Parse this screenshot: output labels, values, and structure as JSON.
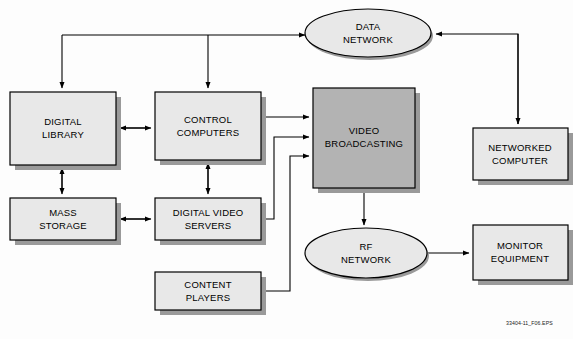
{
  "diagram": {
    "caption": "33404-11_F06.EPS",
    "colors": {
      "background": "#fdfdfd",
      "node_fill": "#e8e8e8",
      "highlight_fill": "#b3b3b3",
      "stroke": "#000000",
      "shadow": "#9a9a9a",
      "text": "#000000"
    },
    "nodes": [
      {
        "id": "data-network",
        "label_line1": "DATA",
        "label_line2": "NETWORK",
        "shape": "ellipse",
        "cx": 368,
        "cy": 33,
        "rx": 63,
        "ry": 24,
        "fill": "#e8e8e8"
      },
      {
        "id": "digital-library",
        "label_line1": "DIGITAL",
        "label_line2": "LIBRARY",
        "shape": "rect",
        "x": 10,
        "y": 92,
        "w": 106,
        "h": 73,
        "fill": "#e8e8e8"
      },
      {
        "id": "control-computers",
        "label_line1": "CONTROL",
        "label_line2": "COMPUTERS",
        "shape": "rect",
        "x": 155,
        "y": 92,
        "w": 106,
        "h": 68,
        "fill": "#e8e8e8"
      },
      {
        "id": "video-broadcasting",
        "label_line1": "VIDEO",
        "label_line2": "BROADCASTING",
        "shape": "rect",
        "x": 313,
        "y": 88,
        "w": 102,
        "h": 100,
        "fill": "#b3b3b3"
      },
      {
        "id": "networked-computer",
        "label_line1": "NETWORKED",
        "label_line2": "COMPUTER",
        "shape": "rect",
        "x": 473,
        "y": 128,
        "w": 95,
        "h": 52,
        "fill": "#e8e8e8"
      },
      {
        "id": "mass-storage",
        "label_line1": "MASS",
        "label_line2": "STORAGE",
        "shape": "rect",
        "x": 10,
        "y": 198,
        "w": 106,
        "h": 42,
        "fill": "#e8e8e8"
      },
      {
        "id": "digital-video-servers",
        "label_line1": "DIGITAL VIDEO",
        "label_line2": "SERVERS",
        "shape": "rect",
        "x": 155,
        "y": 198,
        "w": 106,
        "h": 42,
        "fill": "#e8e8e8"
      },
      {
        "id": "content-players",
        "label_line1": "CONTENT",
        "label_line2": "PLAYERS",
        "shape": "rect",
        "x": 155,
        "y": 272,
        "w": 106,
        "h": 38,
        "fill": "#e8e8e8"
      },
      {
        "id": "rf-network",
        "label_line1": "RF",
        "label_line2": "NETWORK",
        "shape": "ellipse",
        "cx": 366,
        "cy": 253,
        "rx": 61,
        "ry": 25,
        "fill": "#e8e8e8"
      },
      {
        "id": "monitor-equipment",
        "label_line1": "MONITOR",
        "label_line2": "EQUIPMENT",
        "shape": "rect",
        "x": 473,
        "y": 225,
        "w": 95,
        "h": 55,
        "fill": "#e8e8e8"
      }
    ],
    "connections": [
      {
        "id": "bus-to-digital-library",
        "from": "data-bus",
        "to": "digital-library"
      },
      {
        "id": "bus-to-control-computers",
        "from": "data-bus",
        "to": "control-computers"
      },
      {
        "id": "bus-to-data-network",
        "from": "data-bus",
        "to": "data-network"
      },
      {
        "id": "networked-computer-to-data-network",
        "from": "networked-computer",
        "to": "data-network"
      },
      {
        "id": "digital-library-to-control-computers",
        "from": "digital-library",
        "to": "control-computers"
      },
      {
        "id": "digital-library-to-mass-storage",
        "from": "digital-library",
        "to": "mass-storage"
      },
      {
        "id": "mass-storage-to-digital-video-servers",
        "from": "mass-storage",
        "to": "digital-video-servers"
      },
      {
        "id": "control-computers-to-digital-video-servers",
        "from": "control-computers",
        "to": "digital-video-servers"
      },
      {
        "id": "control-computers-to-video-broadcasting",
        "from": "control-computers",
        "to": "video-broadcasting"
      },
      {
        "id": "digital-video-servers-to-video-broadcasting",
        "from": "digital-video-servers",
        "to": "video-broadcasting"
      },
      {
        "id": "content-players-to-video-broadcasting",
        "from": "content-players",
        "to": "video-broadcasting"
      },
      {
        "id": "video-broadcasting-to-rf-network",
        "from": "video-broadcasting",
        "to": "rf-network"
      },
      {
        "id": "rf-network-to-monitor-equipment",
        "from": "rf-network",
        "to": "monitor-equipment"
      }
    ]
  }
}
